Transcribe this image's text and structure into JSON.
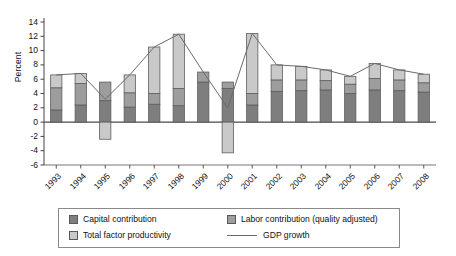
{
  "chart_data": {
    "type": "bar",
    "subtype": "stacked-bar-with-line-overlay",
    "title": "",
    "xlabel": "",
    "ylabel": "Percent",
    "ylim": [
      -6,
      14
    ],
    "yticks": [
      -6,
      -4,
      -2,
      0,
      2,
      4,
      6,
      8,
      10,
      12,
      14
    ],
    "ytick_labels": [
      "-6",
      "-4",
      "-2",
      "0",
      "2",
      "4",
      "6",
      "8",
      "10",
      "12",
      "14"
    ],
    "grid": false,
    "legend_position": "bottom",
    "categories": [
      "1993",
      "1994",
      "1995",
      "1996",
      "1997",
      "1998",
      "1999",
      "2000",
      "2001",
      "2002",
      "2003",
      "2004",
      "2005",
      "2006",
      "2007",
      "2008"
    ],
    "series": [
      {
        "name": "Capital contribution",
        "type": "bar",
        "color": "#7e7e7e",
        "values": [
          1.7,
          2.4,
          3.0,
          2.1,
          2.5,
          2.3,
          5.6,
          4.7,
          2.4,
          4.3,
          4.4,
          4.5,
          4.0,
          4.5,
          4.4,
          4.2
        ]
      },
      {
        "name": "Labor contribution (quality adjusted)",
        "type": "bar",
        "color": "#9d9d9d",
        "values": [
          3.1,
          3.0,
          2.6,
          2.0,
          1.5,
          2.4,
          1.4,
          0.9,
          1.6,
          1.6,
          1.5,
          1.3,
          1.3,
          1.6,
          1.5,
          1.3
        ]
      },
      {
        "name": "Total factor productivity",
        "type": "bar",
        "color": "#c9c9c9",
        "values": [
          1.8,
          1.4,
          -2.4,
          2.5,
          6.5,
          7.6,
          0.0,
          -4.3,
          8.4,
          2.1,
          1.9,
          1.5,
          1.1,
          2.1,
          1.4,
          1.2
        ]
      },
      {
        "name": "GDP growth",
        "type": "line",
        "color": "#6b6b6b",
        "values": [
          6.6,
          6.8,
          3.2,
          6.6,
          10.5,
          12.3,
          7.0,
          2.0,
          12.4,
          8.0,
          7.8,
          7.3,
          6.4,
          8.2,
          7.3,
          6.7
        ]
      }
    ]
  },
  "legend": {
    "items": [
      {
        "label": "Capital contribution",
        "marker": "swatch",
        "color": "#7e7e7e"
      },
      {
        "label": "Labor contribution (quality adjusted)",
        "marker": "swatch",
        "color": "#9d9d9d"
      },
      {
        "label": "Total factor productivity",
        "marker": "swatch",
        "color": "#c9c9c9"
      },
      {
        "label": "GDP growth",
        "marker": "line",
        "color": "#6b6b6b"
      }
    ]
  }
}
